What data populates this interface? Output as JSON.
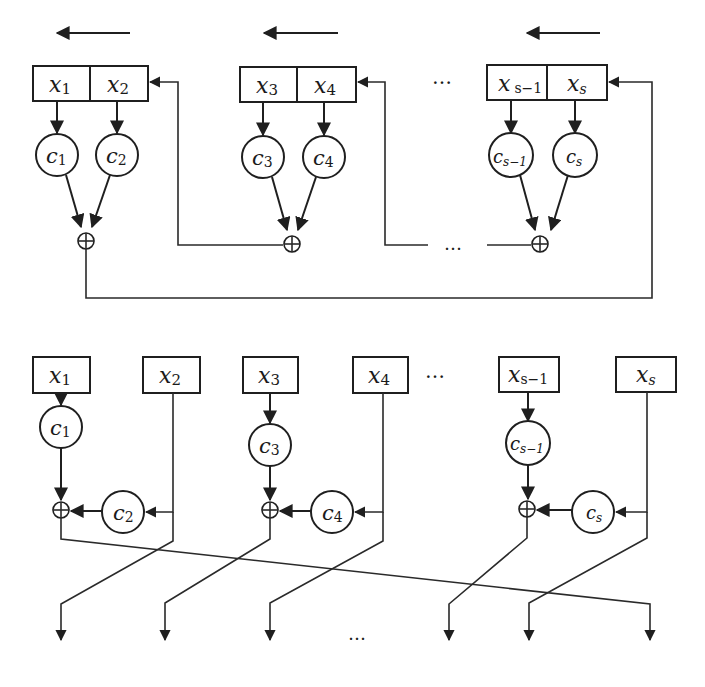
{
  "figure": {
    "top_diagram": {
      "description": "Feedback shift register (Fibonacci form) with shift direction arrows",
      "shift_arrows": [
        {
          "x1": 130,
          "x2": 55,
          "y": 33
        },
        {
          "x1": 338,
          "x2": 262,
          "y": 33
        },
        {
          "x1": 600,
          "x2": 525,
          "y": 33
        }
      ],
      "registers": [
        {
          "cells": [
            {
              "var": "x",
              "sub": "1"
            },
            {
              "var": "x",
              "sub": "2"
            }
          ],
          "x": 33,
          "y": 66,
          "w": 115,
          "h": 35,
          "div": 90
        },
        {
          "cells": [
            {
              "var": "x",
              "sub": "3"
            },
            {
              "var": "x",
              "sub": "4"
            }
          ],
          "x": 240,
          "y": 67,
          "w": 116,
          "h": 35,
          "div": 297
        },
        {
          "cells": [
            {
              "var": "x",
              "sub": "s−1"
            },
            {
              "var": "x",
              "sub": "s"
            }
          ],
          "x": 487,
          "y": 65,
          "w": 120,
          "h": 35,
          "div": 547
        }
      ],
      "multipliers": [
        {
          "var": "c",
          "sub": "1",
          "cx": 57,
          "cy": 155
        },
        {
          "var": "c",
          "sub": "2",
          "cx": 117,
          "cy": 155
        },
        {
          "var": "c",
          "sub": "3",
          "cx": 263,
          "cy": 157
        },
        {
          "var": "c",
          "sub": "4",
          "cx": 324,
          "cy": 157
        },
        {
          "var": "c",
          "sub": "s−1",
          "cx": 511,
          "cy": 155
        },
        {
          "var": "c",
          "sub": "s",
          "cx": 575,
          "cy": 155
        }
      ],
      "xor_nodes": [
        {
          "cx": 86,
          "cy": 241
        },
        {
          "cx": 292,
          "cy": 244
        },
        {
          "cx": 540,
          "cy": 244
        }
      ],
      "ellipsis_labels": [
        "…",
        "…"
      ]
    },
    "bottom_diagram": {
      "description": "Feedback shift register (Galois-like form) with crossing output wires",
      "registers": [
        {
          "var": "x",
          "sub": "1",
          "x": 33,
          "y": 357,
          "w": 57,
          "h": 36
        },
        {
          "var": "x",
          "sub": "2",
          "x": 143,
          "y": 357,
          "w": 57,
          "h": 36
        },
        {
          "var": "x",
          "sub": "3",
          "x": 243,
          "y": 357,
          "w": 55,
          "h": 36
        },
        {
          "var": "x",
          "sub": "4",
          "x": 353,
          "y": 357,
          "w": 55,
          "h": 36
        },
        {
          "var": "x",
          "sub": "s−1",
          "x": 499,
          "y": 357,
          "w": 60,
          "h": 35
        },
        {
          "var": "x",
          "sub": "s",
          "x": 616,
          "y": 357,
          "w": 60,
          "h": 35
        }
      ],
      "multipliers": [
        {
          "var": "c",
          "sub": "1",
          "cx": 61,
          "cy": 427
        },
        {
          "var": "c",
          "sub": "2",
          "cx": 123,
          "cy": 512
        },
        {
          "var": "c",
          "sub": "3",
          "cx": 270,
          "cy": 445
        },
        {
          "var": "c",
          "sub": "4",
          "cx": 332,
          "cy": 512
        },
        {
          "var": "c",
          "sub": "s−1",
          "cx": 528,
          "cy": 443
        },
        {
          "var": "c",
          "sub": "s",
          "cx": 593,
          "cy": 512
        }
      ],
      "xor_nodes": [
        {
          "cx": 61,
          "cy": 510
        },
        {
          "cx": 270,
          "cy": 510
        },
        {
          "cx": 527,
          "cy": 509
        }
      ],
      "outputs_x": [
        61,
        165,
        270,
        449,
        529,
        650
      ],
      "ellipsis_labels": [
        "…",
        "…"
      ]
    }
  }
}
